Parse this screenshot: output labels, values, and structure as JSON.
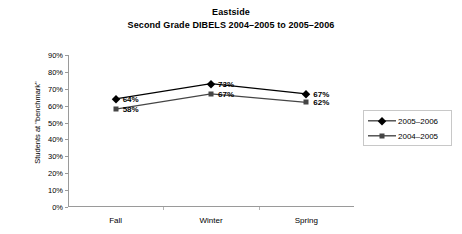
{
  "chart_data": {
    "type": "line",
    "title": "Eastside",
    "subtitle": "Second Grade DIBELS 2004–2005 to 2005–2006",
    "xlabel": "",
    "ylabel": "Students at \"benchmark\"",
    "categories": [
      "Fall",
      "Winter",
      "Spring"
    ],
    "ylim": [
      0,
      90
    ],
    "ytick_labels": [
      "0%",
      "10%",
      "20%",
      "30%",
      "40%",
      "50%",
      "60%",
      "70%",
      "80%",
      "90%"
    ],
    "ytick_values": [
      0,
      10,
      20,
      30,
      40,
      50,
      60,
      70,
      80,
      90
    ],
    "grid": false,
    "legend_position": "right",
    "series": [
      {
        "name": "2005–2006",
        "marker": "diamond",
        "color": "#000000",
        "values": [
          64,
          73,
          67
        ],
        "point_labels": [
          "64%",
          "73%",
          "67%"
        ]
      },
      {
        "name": "2004–2005",
        "marker": "square",
        "color": "#454545",
        "values": [
          58,
          67,
          62
        ],
        "point_labels": [
          "58%",
          "67%",
          "62%"
        ]
      }
    ]
  }
}
